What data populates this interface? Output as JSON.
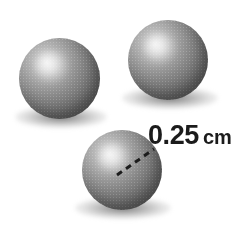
{
  "figure": {
    "background_color": "#ffffff",
    "width": 243,
    "height": 230
  },
  "measurement": {
    "value": "0.25",
    "unit": "cm",
    "full_text": "0.25 cm",
    "color": "#1b1b1b"
  },
  "spheres": [
    {
      "id": "sphere-left",
      "label": "left sphere",
      "cx": 59,
      "cy": 78,
      "diameter": 81,
      "fill_color": "#757575",
      "highlight_color": "#e9e9e9"
    },
    {
      "id": "sphere-top-right",
      "label": "top right sphere",
      "cx": 168,
      "cy": 60,
      "diameter": 80,
      "fill_color": "#757575",
      "highlight_color": "#e9e9e9"
    },
    {
      "id": "sphere-bottom",
      "label": "bottom sphere with radius",
      "cx": 122,
      "cy": 170,
      "diameter": 80,
      "fill_color": "#757575",
      "highlight_color": "#e9e9e9"
    }
  ],
  "radius_line": {
    "style": "dashed",
    "color": "#1c1c1c",
    "from_x": 117,
    "from_y": 175,
    "to_x": 154,
    "to_y": 149
  }
}
